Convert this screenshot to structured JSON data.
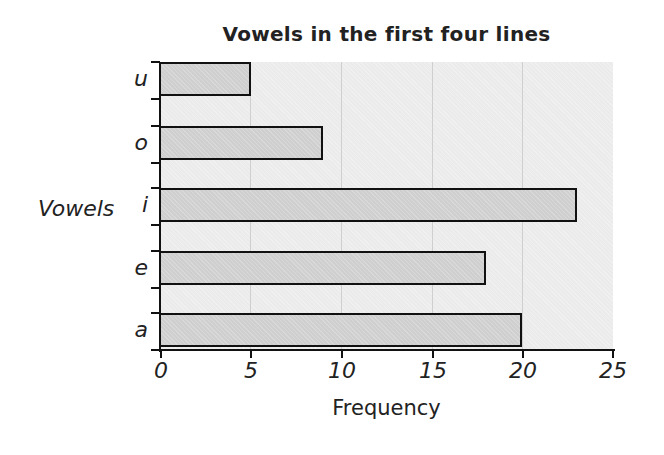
{
  "chart_data": {
    "type": "bar",
    "orientation": "horizontal",
    "title": "Vowels in the first four lines",
    "xlabel": "Frequency",
    "ylabel": "Vowels",
    "categories": [
      "a",
      "e",
      "i",
      "o",
      "u"
    ],
    "values": [
      20,
      18,
      23,
      9,
      5
    ],
    "xlim": [
      0,
      25
    ],
    "xticks": [
      0,
      5,
      10,
      15,
      20,
      25
    ],
    "grid": true,
    "legend": null
  },
  "labels": {
    "title": "Vowels in the first four lines",
    "xlabel": "Frequency",
    "ylabel": "Vowels",
    "xticks": [
      "0",
      "5",
      "10",
      "15",
      "20",
      "25"
    ],
    "cats_top_to_bottom": [
      "u",
      "o",
      "i",
      "e",
      "a"
    ]
  }
}
